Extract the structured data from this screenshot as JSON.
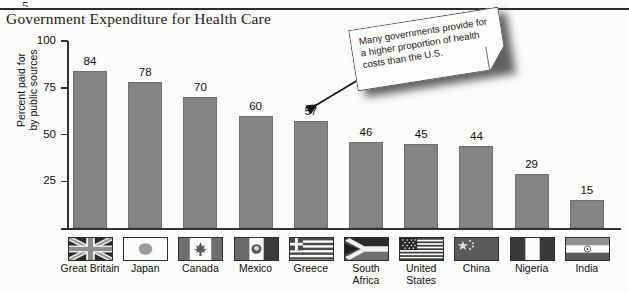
{
  "figure": {
    "stub_label": "5",
    "title": "Government Expenditure for Health Care"
  },
  "callout": {
    "text": "Many governments provide for a higher proportion of health costs than the U.S.",
    "arrow_icon": "arrow-pointer-icon"
  },
  "chart_data": {
    "type": "bar",
    "title": "Government Expenditure for Health Care",
    "xlabel": "",
    "ylabel": "Percent paid for by public sources",
    "ylabel_line1": "Percent paid for",
    "ylabel_line2": "by public sources",
    "ylim": [
      0,
      100
    ],
    "yticks": [
      100,
      75,
      50,
      25
    ],
    "ytick_labels": [
      "100",
      "75",
      "50",
      "25"
    ],
    "grid": false,
    "legend": "none",
    "categories": [
      "Great Britain",
      "Japan",
      "Canada",
      "Mexico",
      "Greece",
      "South Africa",
      "United States",
      "China",
      "Nigeria",
      "India"
    ],
    "category_lines": [
      [
        "Great Britain"
      ],
      [
        "Japan"
      ],
      [
        "Canada"
      ],
      [
        "Mexico"
      ],
      [
        "Greece"
      ],
      [
        "South",
        "Africa"
      ],
      [
        "United",
        "States"
      ],
      [
        "China"
      ],
      [
        "Nigeria"
      ],
      [
        "India"
      ]
    ],
    "values": [
      84,
      78,
      70,
      60,
      57,
      46,
      45,
      44,
      29,
      15
    ],
    "value_labels": [
      "84",
      "78",
      "70",
      "60",
      "57",
      "46",
      "45",
      "44",
      "29",
      "15"
    ],
    "flags": [
      "flag-great-britain",
      "flag-japan",
      "flag-canada",
      "flag-mexico",
      "flag-greece",
      "flag-south-africa",
      "flag-united-states",
      "flag-china",
      "flag-nigeria",
      "flag-india"
    ],
    "bar_color": "#848484",
    "annotations": [
      {
        "text": "Many governments provide for a higher proportion of health costs than the U.S.",
        "points_to": "Greece"
      }
    ]
  }
}
